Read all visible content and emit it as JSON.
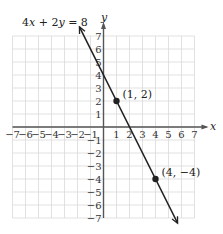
{
  "chart_data": {
    "type": "line",
    "title": "4x + 2y = 8",
    "equation_label": "4x + 2y = 8",
    "xlabel": "x",
    "ylabel": "y",
    "xlim": [
      -7,
      7
    ],
    "ylim": [
      -7,
      7
    ],
    "grid": true,
    "x_ticks": [
      "−7",
      "−6",
      "−5",
      "−4",
      "−3",
      "−2",
      "−1",
      "1",
      "2",
      "3",
      "4",
      "5",
      "6",
      "7"
    ],
    "y_ticks": [
      "7",
      "6",
      "5",
      "4",
      "3",
      "2",
      "1",
      "−1",
      "−2",
      "−3",
      "−4",
      "−5",
      "−6",
      "−7"
    ],
    "series": [
      {
        "name": "4x + 2y = 8",
        "slope": -2,
        "intercept": 4,
        "points": [
          {
            "x": 1,
            "y": 2,
            "label": "(1, 2)"
          },
          {
            "x": 4,
            "y": -4,
            "label": "(4, −4)"
          }
        ]
      }
    ],
    "colors": {
      "line": "#222222",
      "grid": "#d9d9d9",
      "axis": "#555555"
    }
  }
}
